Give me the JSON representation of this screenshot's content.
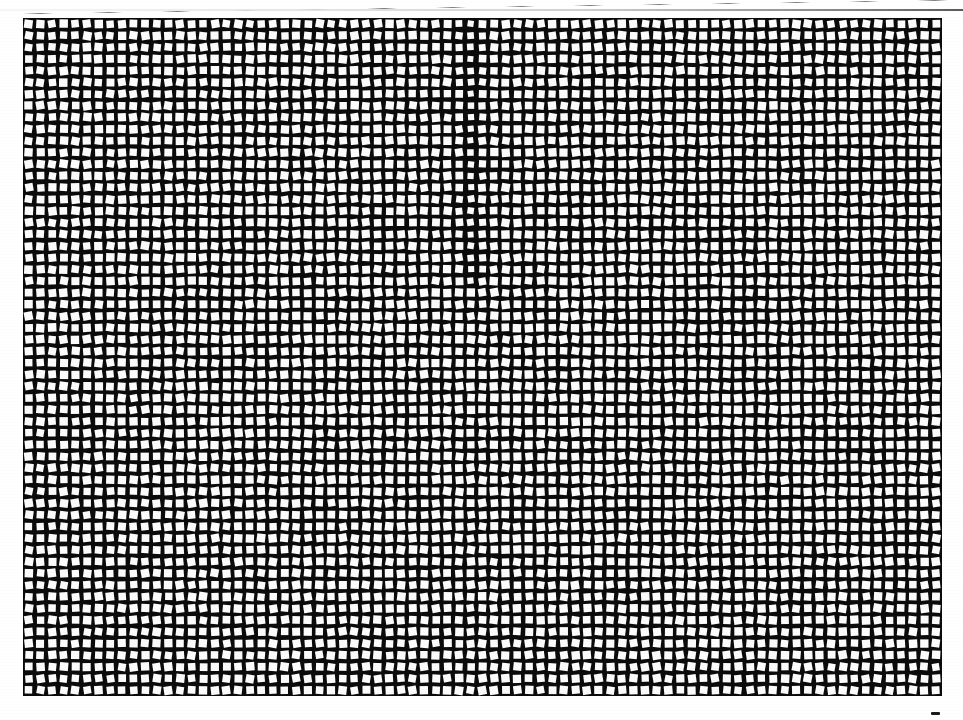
{
  "page": {
    "width": 963,
    "height": 720,
    "background_color": "#ffffff",
    "title": "Scanned grid test pattern",
    "description": "Full-bleed scan of a printed halftone calibration sheet: a dense rectangular lattice of small white squares, each slightly and randomly rotated, printed on a solid black field."
  },
  "artifacts": {
    "top_scan_line": {
      "name": "top-scan-line",
      "color": "#6e6e6e",
      "x": 0,
      "y": 9,
      "width": 963,
      "height": 2
    },
    "stray_ink_mark": {
      "name": "stray-ink-mark",
      "color": "#1b1b1b",
      "x": 931,
      "y": 712,
      "width": 9,
      "height": 3
    }
  },
  "chart_data": {
    "type": "heatmap",
    "title": "Scanned grid test pattern",
    "subtitle": "Randomly rotated white squares on a black field",
    "xlabel": "",
    "ylabel": "",
    "grid": true,
    "legend": "none",
    "plate": {
      "x": 23,
      "y": 18,
      "width": 919,
      "height": 678,
      "background_color": "#0b0b0b",
      "square_color": "#fbfbfb"
    },
    "lattice": {
      "columns": 79,
      "rows": 58,
      "cell_width": 11.63,
      "cell_height": 11.69,
      "square_size": 7.9,
      "gap": 3.7,
      "rotation_range_deg": [
        -11,
        11
      ],
      "jitter_px": 0.9
    },
    "seam": {
      "column_index": 38,
      "row_start": 0,
      "row_end": 22,
      "description": "Faint darker vertical seam in the upper half where squares print slightly smaller",
      "square_scale": 0.8
    },
    "categories": [],
    "values": []
  }
}
